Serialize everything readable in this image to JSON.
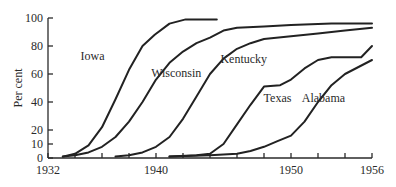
{
  "chart_data": {
    "type": "line",
    "title": "",
    "xlabel": "",
    "ylabel": "Per cent",
    "xlim": [
      1932,
      1956
    ],
    "ylim": [
      0,
      100
    ],
    "grid": false,
    "legend": "inline labels",
    "x_tick_labels": [
      "1932",
      "1940",
      "1950",
      "1956"
    ],
    "x_tick_values": [
      1932,
      1933,
      1934,
      1935,
      1936,
      1937,
      1938,
      1939,
      1940,
      1941,
      1942,
      1943,
      1944,
      1945,
      1946,
      1947,
      1948,
      1949,
      1950,
      1951,
      1952,
      1953,
      1954,
      1955,
      1956
    ],
    "x_major_ticks": [
      1932,
      1934,
      1936,
      1938,
      1940,
      1942,
      1944,
      1946,
      1948,
      1950,
      1952,
      1954,
      1956
    ],
    "y_tick_labels": [
      "0",
      "10",
      "20",
      "40",
      "60",
      "80",
      "100"
    ],
    "y_tick_values": [
      0,
      10,
      20,
      40,
      60,
      80,
      100
    ],
    "series": [
      {
        "name": "Iowa",
        "label_pos": [
          1935.3,
          70
        ],
        "points": [
          [
            1933.1,
            1
          ],
          [
            1934,
            3
          ],
          [
            1935,
            9
          ],
          [
            1936,
            22
          ],
          [
            1937,
            42
          ],
          [
            1938,
            63
          ],
          [
            1939,
            80
          ],
          [
            1939.9,
            88
          ],
          [
            1941,
            96
          ],
          [
            1942.2,
            99
          ],
          [
            1944.5,
            99
          ]
        ]
      },
      {
        "name": "Wisconsin",
        "label_pos": [
          1941.5,
          58
        ],
        "points": [
          [
            1933.1,
            1
          ],
          [
            1934,
            2
          ],
          [
            1935,
            4
          ],
          [
            1936,
            8
          ],
          [
            1937,
            15
          ],
          [
            1938,
            26
          ],
          [
            1939,
            40
          ],
          [
            1940,
            56
          ],
          [
            1941,
            68
          ],
          [
            1942,
            76
          ],
          [
            1943,
            82
          ],
          [
            1944,
            86
          ],
          [
            1945,
            91
          ],
          [
            1946,
            93
          ],
          [
            1948,
            94
          ],
          [
            1950,
            95
          ],
          [
            1953,
            96
          ],
          [
            1956,
            96
          ]
        ]
      },
      {
        "name": "Kentucky",
        "label_pos": [
          1946.5,
          68
        ],
        "points": [
          [
            1937,
            1
          ],
          [
            1938,
            2
          ],
          [
            1939,
            4
          ],
          [
            1940,
            8
          ],
          [
            1941,
            15
          ],
          [
            1942,
            28
          ],
          [
            1943,
            44
          ],
          [
            1944,
            60
          ],
          [
            1945,
            71
          ],
          [
            1946,
            78
          ],
          [
            1947,
            82
          ],
          [
            1948,
            85
          ],
          [
            1950,
            87
          ],
          [
            1952,
            89
          ],
          [
            1954,
            91
          ],
          [
            1956,
            93
          ]
        ]
      },
      {
        "name": "Texas",
        "label_pos": [
          1949,
          40
        ],
        "points": [
          [
            1941,
            1
          ],
          [
            1943,
            2
          ],
          [
            1944,
            3
          ],
          [
            1945,
            10
          ],
          [
            1946,
            24
          ],
          [
            1947,
            38
          ],
          [
            1948,
            51
          ],
          [
            1949.2,
            52
          ],
          [
            1950,
            56
          ],
          [
            1951,
            64
          ],
          [
            1952,
            70
          ],
          [
            1953,
            72
          ],
          [
            1955.2,
            72
          ],
          [
            1956,
            80
          ]
        ]
      },
      {
        "name": "Alabama",
        "label_pos": [
          1952.4,
          40
        ],
        "points": [
          [
            1941,
            1
          ],
          [
            1944,
            2
          ],
          [
            1946,
            3
          ],
          [
            1947,
            5
          ],
          [
            1948,
            8
          ],
          [
            1949,
            12
          ],
          [
            1950,
            16
          ],
          [
            1951,
            26
          ],
          [
            1952,
            40
          ],
          [
            1953,
            52
          ],
          [
            1954,
            60
          ],
          [
            1955,
            65
          ],
          [
            1956,
            70
          ]
        ]
      }
    ]
  },
  "axes": {
    "ylabel": "Per cent"
  }
}
